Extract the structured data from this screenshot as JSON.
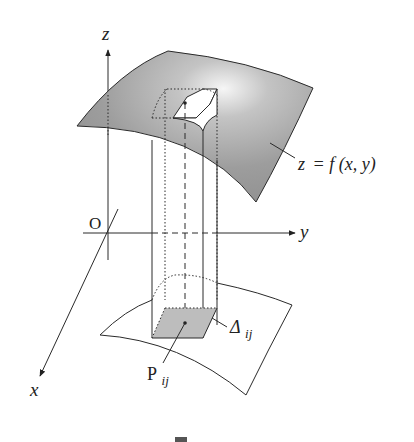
{
  "figure": {
    "type": "3d-double-integral-illustration",
    "labels": {
      "z_axis": "z",
      "y_axis": "y",
      "x_axis": "x",
      "origin": "O",
      "surface_eq_lhs": "z",
      "surface_eq_rhs": "= f (x, y)",
      "delta_main": "Δ",
      "delta_sub": "ij",
      "point_main": "P",
      "point_sub": "ij"
    },
    "colors": {
      "surface_fill": "#9e9e9e",
      "surface_highlight": "#f4f4f4",
      "base_fill": "#bdbdbd",
      "stroke": "#2a2a2a",
      "background": "#ffffff"
    }
  }
}
